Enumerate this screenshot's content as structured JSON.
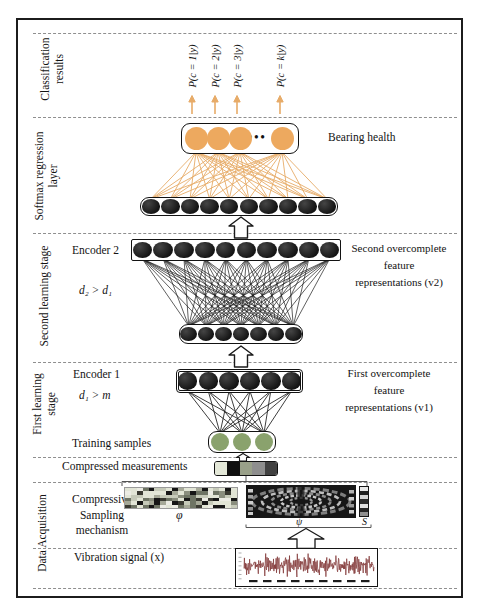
{
  "sections": {
    "classification": {
      "label_lines": [
        "Classification",
        "results"
      ]
    },
    "softmax": {
      "label_lines": [
        "Softmax regression",
        "layer"
      ]
    },
    "second_stage": {
      "label_lines": [
        "Second learning stage"
      ]
    },
    "first_stage": {
      "label_lines": [
        "First learning",
        "stage"
      ]
    },
    "data_acquisition": {
      "label_lines": [
        "Data Acquisition"
      ]
    }
  },
  "classification": {
    "outputs": [
      "P(c = 1|y)",
      "P(c = 2|y)",
      "P(c = 3|y)",
      "P(c = k|y)"
    ]
  },
  "softmax": {
    "bearing_health": "Bearing health",
    "ellipsis": "•••"
  },
  "second_stage": {
    "encoder": "Encoder 2",
    "dims": "d₂ > d₁",
    "note_lines": [
      "Second overcomplete",
      "feature",
      "representations (v2)"
    ]
  },
  "first_stage": {
    "encoder": "Encoder 1",
    "dims": "d₁ > m",
    "training": "Training samples",
    "note_lines": [
      "First overcomplete",
      "feature",
      "representations (v1)"
    ]
  },
  "compressed": {
    "label": "Compressed measurements",
    "segment_colors": [
      "#e4e8d8",
      "#101010",
      "#99a089",
      "#8e8e8e",
      "#414141"
    ]
  },
  "acquisition": {
    "mechanism_lines": [
      "Compressive",
      "Sampling",
      "mechanism"
    ],
    "phi": "φ",
    "psi": "ψ",
    "s": "S",
    "vibration": "Vibration signal (x)",
    "phi_grid": {
      "rows": 6,
      "cols": 19,
      "palette": [
        "#e2e5d6",
        "#c6cab9",
        "#161616",
        "#6e7464",
        "#a6a998",
        "#3a3a32",
        "#8a8e7e",
        "#ecece4"
      ]
    },
    "s_cells": [
      "#e8e8e8",
      "#1f1f1f",
      "#d5d5d5",
      "#2b2b2b",
      "#e0e0e0",
      "#262626",
      "#909090"
    ]
  },
  "layers": {
    "softmax_out": {
      "count": 4,
      "color": "orange_node"
    },
    "softmax_in": {
      "count": 10,
      "color": "dark_node"
    },
    "enc2_out": {
      "count": 10,
      "color": "dark_node"
    },
    "enc2_in": {
      "count": 7,
      "color": "dark_node"
    },
    "enc1_out": {
      "count": 6,
      "color": "dark_node"
    },
    "enc1_in": {
      "count": 3,
      "color": "green_node"
    }
  },
  "colors": {
    "orange_node": "#eda95f",
    "orange_line": "#e7ab68",
    "dark_node": "#1f1e1e",
    "green_node": "#8aa26d",
    "signal": "#7d2f2f"
  }
}
